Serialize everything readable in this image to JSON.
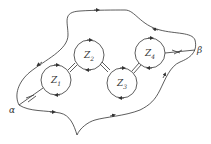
{
  "diagram": {
    "type": "contour-diagram",
    "line_color": "#333333",
    "background": "#ffffff",
    "points": [
      {
        "id": "alpha",
        "label": "α"
      },
      {
        "id": "beta",
        "label": "β"
      }
    ],
    "circles": [
      {
        "id": "z1",
        "label": "Z",
        "sub": "1"
      },
      {
        "id": "z2",
        "label": "Z",
        "sub": "2"
      },
      {
        "id": "z3",
        "label": "Z",
        "sub": "3"
      },
      {
        "id": "z4",
        "label": "Z",
        "sub": "4"
      }
    ]
  }
}
